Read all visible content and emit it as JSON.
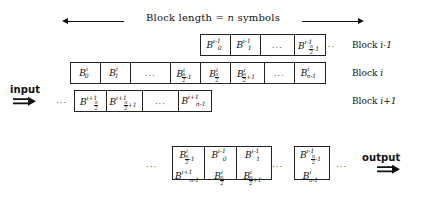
{
  "figure": {
    "header": {
      "text_prefix": "Block length = ",
      "text_var": "n",
      "text_suffix": " symbols",
      "full_text": "Block length = n symbols",
      "left_arrow": "left-arrow",
      "right_arrow": "right-arrow"
    },
    "input_label": "input",
    "output_label": "output",
    "input_arrow": "double-right-arrow",
    "output_arrow": "double-right-arrow",
    "ellipsis": "...",
    "row_labels": {
      "block_prev": "Block i-1",
      "block_cur": "Block i",
      "block_next": "Block i+1",
      "block_prev_prefix": "Block ",
      "block_prev_var": "i-1",
      "block_cur_prefix": "Block ",
      "block_cur_var": "i",
      "block_next_prefix": "Block ",
      "block_next_var": "i+1"
    },
    "rows": [
      {
        "name": "block-i-minus-1",
        "label": "Block i-1",
        "trailing_dots": true,
        "cells": [
          {
            "type": "sym",
            "base": "B",
            "sup": "i-1",
            "sub": "0",
            "sub_frac": false,
            "text": "B_0^{i-1}"
          },
          {
            "type": "sym",
            "base": "B",
            "sup": "i-1",
            "sub": "1",
            "sub_frac": false,
            "text": "B_1^{i-1}"
          },
          {
            "type": "dots",
            "text": "..."
          },
          {
            "type": "sym",
            "base": "B",
            "sup": "i-1",
            "sub": "n/2-1",
            "sub_frac": true,
            "frac_num": "n",
            "frac_den": "2",
            "frac_tail": "-1",
            "text": "B_{n/2-1}^{i-1}"
          }
        ]
      },
      {
        "name": "block-i",
        "label": "Block i",
        "trailing_dots": false,
        "cells": [
          {
            "type": "sym",
            "base": "B",
            "sup": "i",
            "sub": "0",
            "sub_frac": false,
            "text": "B_0^{i}"
          },
          {
            "type": "sym",
            "base": "B",
            "sup": "i",
            "sub": "1",
            "sub_frac": false,
            "text": "B_1^{i}"
          },
          {
            "type": "dots",
            "text": "..."
          },
          {
            "type": "sym",
            "base": "B",
            "sup": "i",
            "sub": "n/2-1",
            "sub_frac": true,
            "frac_num": "n",
            "frac_den": "2",
            "frac_tail": "-1",
            "text": "B_{n/2-1}^{i}"
          },
          {
            "type": "sym",
            "base": "B",
            "sup": "i",
            "sub": "n/2",
            "sub_frac": true,
            "frac_num": "n",
            "frac_den": "2",
            "frac_tail": "",
            "text": "B_{n/2}^{i}"
          },
          {
            "type": "sym",
            "base": "B",
            "sup": "i",
            "sub": "n/2+1",
            "sub_frac": true,
            "frac_num": "n",
            "frac_den": "2",
            "frac_tail": "+1",
            "text": "B_{n/2+1}^{i}"
          },
          {
            "type": "dots",
            "text": "..."
          },
          {
            "type": "sym",
            "base": "B",
            "sup": "i",
            "sub": "n-1",
            "sub_frac": false,
            "text": "B_{n-1}^{i}"
          }
        ]
      },
      {
        "name": "block-i-plus-1",
        "label": "Block i+1",
        "leading_dots": true,
        "cells": [
          {
            "type": "sym",
            "base": "B",
            "sup": "i+1",
            "sub": "n/2",
            "sub_frac": true,
            "frac_num": "n",
            "frac_den": "2",
            "frac_tail": "",
            "text": "B_{n/2}^{i+1}"
          },
          {
            "type": "sym",
            "base": "B",
            "sup": "i+1",
            "sub": "n/2+1",
            "sub_frac": true,
            "frac_num": "n",
            "frac_den": "2",
            "frac_tail": "+1",
            "text": "B_{n/2+1}^{i+1}"
          },
          {
            "type": "dots",
            "text": "..."
          },
          {
            "type": "sym",
            "base": "B",
            "sup": "i+1",
            "sub": "n-1",
            "sub_frac": false,
            "text": "B_{n-1}^{i+1}"
          }
        ]
      }
    ],
    "output_row": {
      "name": "output-row",
      "leading_dots": true,
      "trailing_dots": true,
      "inner_dots": true,
      "cells": [
        {
          "top": {
            "base": "B",
            "sup": "i",
            "sub": "n/2-1",
            "sub_frac": true,
            "frac_num": "n",
            "frac_den": "2",
            "frac_tail": "-1",
            "text": "B_{n/2-1}^{i}"
          },
          "bottom": {
            "base": "B",
            "sup": "i+1",
            "sub": "n-1",
            "sub_frac": false,
            "text": "B_{n-1}^{i+1}"
          }
        },
        {
          "top": {
            "base": "B",
            "sup": "i-1",
            "sub": "0",
            "sub_frac": false,
            "text": "B_0^{i-1}"
          },
          "bottom": {
            "base": "B",
            "sup": "i",
            "sub": "n/2",
            "sub_frac": true,
            "frac_num": "n",
            "frac_den": "2",
            "frac_tail": "",
            "text": "B_{n/2}^{i}"
          }
        },
        {
          "top": {
            "base": "B",
            "sup": "i-1",
            "sub": "1",
            "sub_frac": false,
            "text": "B_1^{i-1}"
          },
          "bottom": {
            "base": "B",
            "sup": "i",
            "sub": "n/2+1",
            "sub_frac": true,
            "frac_num": "n",
            "frac_den": "2",
            "frac_tail": "+1",
            "text": "B_{n/2+1}^{i}"
          }
        },
        {
          "top": {
            "base": "B",
            "sup": "i-1",
            "sub": "n/2-1",
            "sub_frac": true,
            "frac_num": "n",
            "frac_den": "2",
            "frac_tail": "-1",
            "text": "B_{n/2-1}^{i-1}"
          },
          "bottom": {
            "base": "B",
            "sup": "i",
            "sub": "n-1",
            "sub_frac": false,
            "text": "B_{n-1}^{i}"
          }
        }
      ]
    }
  }
}
